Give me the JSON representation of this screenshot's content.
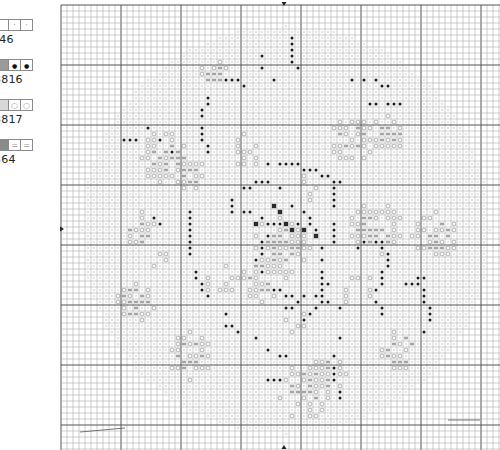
{
  "legend": {
    "items": [
      {
        "code": "746",
        "label": "746",
        "fill": "#ffffff",
        "symbol": "dot-light",
        "top": 19
      },
      {
        "code": "3816",
        "label": "3816",
        "fill": "#9a9a9a",
        "symbol": "dot-dark",
        "top": 59
      },
      {
        "code": "3817",
        "label": "3817",
        "fill": "#d8d8d8",
        "symbol": "ring",
        "top": 99
      },
      {
        "code": "564",
        "label": "564",
        "fill": "#8a8a8a",
        "symbol": "equals",
        "top": 139
      }
    ],
    "visible_labels_cropped": [
      "746",
      "3816",
      "3817",
      "564"
    ]
  },
  "chart_data": {
    "type": "cross-stitch-pattern",
    "title": "",
    "grid": {
      "origin_x": 61,
      "origin_y": 5,
      "cell_px": 6,
      "major_every": 10,
      "cols": 73,
      "rows": 74,
      "minor_color": "#9c9c9c",
      "major_color": "#555555"
    },
    "center_markers": {
      "top": {
        "x": 284,
        "y": 5
      },
      "bottom": {
        "x": 284,
        "y": 446
      },
      "left": {
        "x": 63,
        "y": 229
      }
    },
    "motif": {
      "shape": "circular floral wreath",
      "center_col": 37,
      "center_row": 37,
      "background_radius_cells": 34,
      "colors": {
        "746": "#c8c8c8",
        "3816": "#1e1e1e",
        "3817": "#b0b0b0",
        "564": "#6d6d6d"
      }
    },
    "legend": [
      "746",
      "3816",
      "3817",
      "564"
    ]
  }
}
